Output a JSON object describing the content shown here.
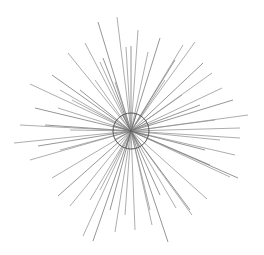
{
  "illustration": {
    "subject": "starburst wall decor line drawing",
    "background": "#ffffff",
    "ray_color": "#8a8a8a",
    "ring_color": "#555555",
    "center": [
      131,
      131
    ],
    "ring_radius": 18,
    "rays": [
      [
        98,
        22
      ],
      [
        117,
        17
      ],
      [
        138,
        30
      ],
      [
        160,
        38
      ],
      [
        183,
        45
      ],
      [
        195,
        42
      ],
      [
        203,
        63
      ],
      [
        212,
        73
      ],
      [
        222,
        88
      ],
      [
        233,
        100
      ],
      [
        248,
        115
      ],
      [
        30,
        84
      ],
      [
        52,
        75
      ],
      [
        68,
        53
      ],
      [
        85,
        43
      ],
      [
        103,
        58
      ],
      [
        126,
        47
      ],
      [
        148,
        52
      ],
      [
        35,
        108
      ],
      [
        58,
        108
      ],
      [
        72,
        100
      ],
      [
        80,
        90
      ],
      [
        100,
        62
      ],
      [
        115,
        82
      ],
      [
        131,
        46
      ],
      [
        165,
        80
      ],
      [
        182,
        95
      ],
      [
        200,
        105
      ],
      [
        215,
        120
      ],
      [
        14,
        143
      ],
      [
        38,
        146
      ],
      [
        30,
        160
      ],
      [
        52,
        178
      ],
      [
        58,
        196
      ],
      [
        70,
        206
      ],
      [
        83,
        236
      ],
      [
        93,
        241
      ],
      [
        115,
        232
      ],
      [
        135,
        230
      ],
      [
        168,
        242
      ],
      [
        152,
        225
      ],
      [
        176,
        208
      ],
      [
        190,
        210
      ],
      [
        207,
        199
      ],
      [
        230,
        177
      ],
      [
        238,
        178
      ],
      [
        235,
        155
      ],
      [
        240,
        138
      ],
      [
        205,
        150
      ],
      [
        192,
        215
      ],
      [
        20,
        125
      ],
      [
        45,
        125
      ],
      [
        240,
        128
      ],
      [
        60,
        150
      ],
      [
        110,
        210
      ],
      [
        125,
        215
      ],
      [
        150,
        210
      ],
      [
        160,
        195
      ],
      [
        90,
        200
      ],
      [
        100,
        190
      ],
      [
        210,
        165
      ],
      [
        220,
        140
      ],
      [
        70,
        130
      ],
      [
        175,
        60
      ],
      [
        95,
        80
      ],
      [
        60,
        90
      ]
    ]
  }
}
